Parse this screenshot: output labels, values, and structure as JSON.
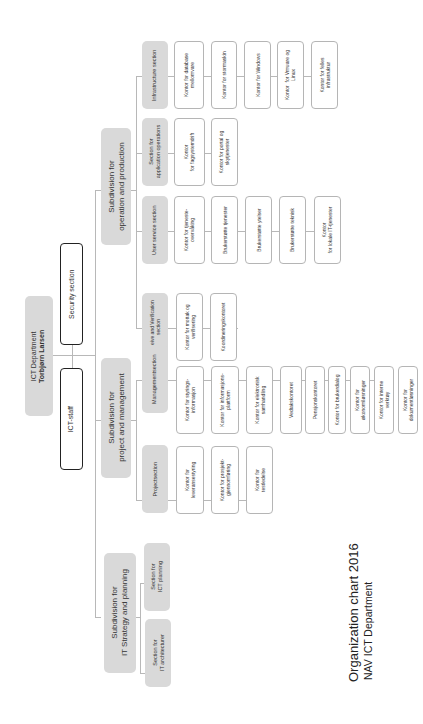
{
  "top": {
    "department": "ICT Department",
    "head": "Torbjørn Larsen",
    "security": "Security section",
    "staff": "ICT-staff"
  },
  "subdivisions": {
    "operation": {
      "label": "Subdivision for\noperation and production",
      "sections": {
        "infrastructure": {
          "label": "Infrastructure section",
          "offices": [
            "Kontor for database\nmellomvare",
            "Kontor for stormaskin",
            "Kontor for Windows",
            "Kontor  for Vmware og\nLinux",
            "Kontor for felles\ninfrastruktur"
          ]
        },
        "application": {
          "label": "Section for\napplication operations",
          "offices": [
            "Kontor\nfor fagsystemdrift",
            "Kontor for portal og\nskytjenester"
          ]
        },
        "userservice": {
          "label": "User service section",
          "offices": [
            "Kontor for tjeneste-\novervåking",
            "Brukerstøtte tjenester",
            "Brukerstøtte ytelser",
            "Brukerstøtte teknisk",
            "Kontor\nfor lokale IT-tjenester"
          ]
        },
        "receive": {
          "label": "Receive and Verification\nsection",
          "offices": [
            "Kontor for mottak og\nverifisering",
            "Koordineringskontoret"
          ]
        }
      }
    },
    "project": {
      "label": "Subdivision for\nproject and management",
      "sections": {
        "management": {
          "label": "Managementsection",
          "offices": [
            "Kontor for styrings-\ninformasjon",
            "Kontor for informasjons-\nplattform",
            "Kontor for elektronisk\nsamhandling",
            "Vedtakskontoret",
            "Pensjonskontoret",
            "Kontor for brukerdialog",
            "Kontor for\nøkonomiløsninger",
            "Kontor for interne\nverktøy",
            "Kontor for\ndokumentløsninger"
          ]
        },
        "projectsec": {
          "label": "Projectsection",
          "offices": [
            "Kontor for\nleveransestyring",
            "Kontor for prosjekt-\ngjennomføring",
            "Kontor for\ntestledelse"
          ]
        }
      }
    },
    "strategy": {
      "label": "Subdivision for\nIT Strategy and planning",
      "sections": {
        "planning": {
          "label": "Section for\nICT planning"
        },
        "architecture": {
          "label": "Section for\nIT architecturer"
        }
      }
    }
  },
  "caption": {
    "line1": "Organization chart  2016",
    "line2": "NAV ICT Department"
  }
}
